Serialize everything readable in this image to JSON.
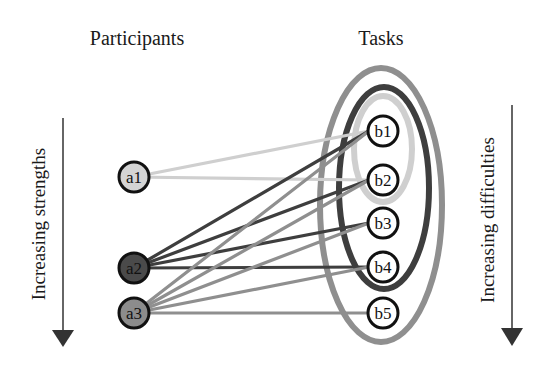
{
  "headers": {
    "participants": "Participants",
    "tasks": "Tasks"
  },
  "axes": {
    "left": {
      "label": "Increasing strengths",
      "direction": "down"
    },
    "right": {
      "label": "Increasing difficulties",
      "direction": "down"
    }
  },
  "participants": [
    {
      "id": "a1",
      "label": "a1",
      "fill": "#d4d4d4",
      "x": 134,
      "y": 177
    },
    {
      "id": "a2",
      "label": "a2",
      "fill": "#4a4a4a",
      "x": 134,
      "y": 268
    },
    {
      "id": "a3",
      "label": "a3",
      "fill": "#8c8c8c",
      "x": 134,
      "y": 313
    }
  ],
  "tasks": [
    {
      "id": "b1",
      "label": "b1",
      "fill": "#ffffff",
      "x": 383,
      "y": 131
    },
    {
      "id": "b2",
      "label": "b2",
      "fill": "#ffffff",
      "x": 383,
      "y": 180
    },
    {
      "id": "b3",
      "label": "b3",
      "fill": "#ffffff",
      "x": 383,
      "y": 223
    },
    {
      "id": "b4",
      "label": "b4",
      "fill": "#ffffff",
      "x": 383,
      "y": 267
    },
    {
      "id": "b5",
      "label": "b5",
      "fill": "#ffffff",
      "x": 383,
      "y": 313
    }
  ],
  "groups": [
    {
      "name": "outer-ellipse",
      "members": [
        "b1",
        "b2",
        "b3",
        "b4",
        "b5"
      ],
      "color": "#8f8f8f",
      "cx": 381,
      "cy": 205,
      "rx": 61,
      "ry": 137
    },
    {
      "name": "middle-ellipse",
      "members": [
        "b1",
        "b2",
        "b3",
        "b4"
      ],
      "color": "#3e3e3e",
      "cx": 384,
      "cy": 188,
      "rx": 45,
      "ry": 101
    },
    {
      "name": "inner-ellipse",
      "members": [
        "b1",
        "b2"
      ],
      "color": "#cfcfcf",
      "cx": 383,
      "cy": 149,
      "rx": 29,
      "ry": 53
    }
  ],
  "edges": [
    {
      "from": "a1",
      "to": "b1",
      "color": "#cfcfcf"
    },
    {
      "from": "a1",
      "to": "b2",
      "color": "#cfcfcf"
    },
    {
      "from": "a2",
      "to": "b1",
      "color": "#3e3e3e"
    },
    {
      "from": "a2",
      "to": "b2",
      "color": "#3e3e3e"
    },
    {
      "from": "a2",
      "to": "b3",
      "color": "#3e3e3e"
    },
    {
      "from": "a2",
      "to": "b4",
      "color": "#3e3e3e"
    },
    {
      "from": "a3",
      "to": "b1",
      "color": "#8f8f8f"
    },
    {
      "from": "a3",
      "to": "b2",
      "color": "#8f8f8f"
    },
    {
      "from": "a3",
      "to": "b3",
      "color": "#8f8f8f"
    },
    {
      "from": "a3",
      "to": "b4",
      "color": "#8f8f8f"
    },
    {
      "from": "a3",
      "to": "b5",
      "color": "#8f8f8f"
    }
  ]
}
